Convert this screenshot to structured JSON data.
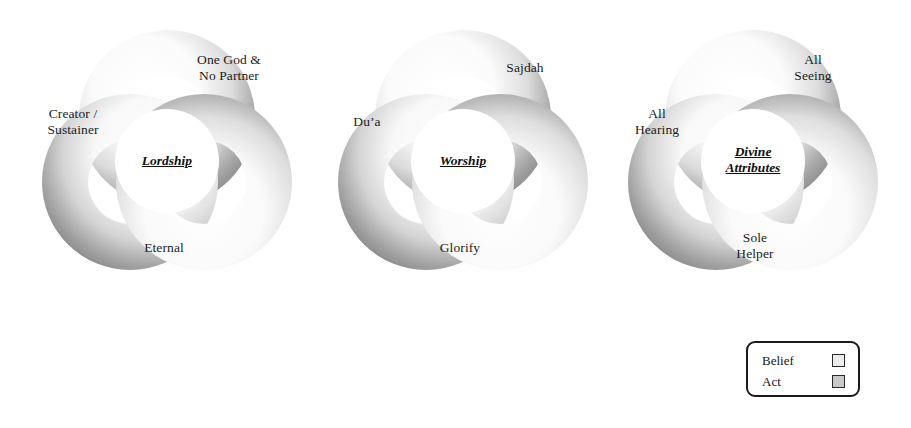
{
  "page": {
    "background_color": "#ffffff"
  },
  "diagrams": [
    {
      "id": "lordship",
      "center_label": "Lordship",
      "lobes": [
        {
          "position": "top-right",
          "label": "One God &\nNo Partner"
        },
        {
          "position": "left",
          "label": "Creator /\nSustainer"
        },
        {
          "position": "bottom",
          "label": "Eternal"
        }
      ]
    },
    {
      "id": "worship",
      "center_label": "Worship",
      "lobes": [
        {
          "position": "top-right",
          "label": "Sajdah"
        },
        {
          "position": "left",
          "label": "Du’a"
        },
        {
          "position": "bottom",
          "label": "Glorify"
        }
      ]
    },
    {
      "id": "divine-attributes",
      "center_label": "Divine\nAttributes",
      "lobes": [
        {
          "position": "top-right",
          "label": "All\nSeeing"
        },
        {
          "position": "left",
          "label": "All\nHearing"
        },
        {
          "position": "bottom",
          "label": "Sole\nHelper"
        }
      ]
    }
  ],
  "legend": {
    "items": [
      {
        "label": "Belief",
        "swatch_color": "#ececec"
      },
      {
        "label": "Act",
        "swatch_color": "#c9c9c9"
      }
    ],
    "border_color": "#1a1a1a"
  },
  "colors": {
    "ring_light": "#ffffff",
    "ring_mid": "#d8d8d8",
    "ring_dark": "#8e8e8e",
    "text": "#1c1c1c"
  }
}
